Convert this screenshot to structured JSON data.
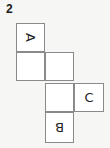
{
  "figure": {
    "number": "2"
  },
  "net": {
    "cell_size": 29,
    "cells": [
      {
        "row": 0,
        "col": 0,
        "letter": "A",
        "rotation": 90
      },
      {
        "row": 1,
        "col": 0,
        "letter": "",
        "rotation": 0
      },
      {
        "row": 1,
        "col": 1,
        "letter": "",
        "rotation": 0
      },
      {
        "row": 2,
        "col": 1,
        "letter": "",
        "rotation": 0
      },
      {
        "row": 2,
        "col": 2,
        "letter": "C",
        "rotation": 0
      },
      {
        "row": 3,
        "col": 1,
        "letter": "B",
        "rotation": 180
      }
    ]
  },
  "colors": {
    "background": "#f6f6f4",
    "cell_fill": "#ffffff",
    "border": "#8a8a8a",
    "text": "#222222"
  }
}
